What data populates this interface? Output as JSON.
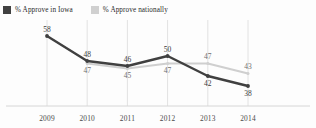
{
  "legend": {
    "items": [
      {
        "label": "% Approve in Iowa",
        "color": "#404040",
        "key": "iowa"
      },
      {
        "label": "% Approve nationally",
        "color": "#d0d0d0",
        "key": "national"
      }
    ]
  },
  "axis": {
    "x_ticks": [
      "2009",
      "2010",
      "2011",
      "2012",
      "2013",
      "2014"
    ]
  },
  "chart_data": {
    "type": "line",
    "title": "",
    "subtitle": "",
    "xlabel": "",
    "ylabel": "",
    "categories": [
      "2009",
      "2010",
      "2011",
      "2012",
      "2013",
      "2014"
    ],
    "series": [
      {
        "name": "% Approve in Iowa",
        "color": "#404040",
        "values": [
          58,
          48,
          46,
          50,
          42,
          38
        ],
        "label_positions": [
          "above",
          "above",
          "above",
          "above",
          "below",
          "below"
        ]
      },
      {
        "name": "% Approve nationally",
        "color": "#d0d0d0",
        "values": [
          null,
          47,
          45,
          47,
          47,
          43
        ],
        "label_positions": [
          null,
          "below",
          "below",
          "below",
          "above",
          "above"
        ]
      }
    ],
    "ylim": [
      30,
      62
    ],
    "grid": "vertical",
    "legend_position": "top-left",
    "data_labels": true
  },
  "labels": {
    "iowa": [
      "58",
      "48",
      "46",
      "50",
      "42",
      "38"
    ],
    "national": [
      "",
      "47",
      "45",
      "47",
      "47",
      "43"
    ]
  },
  "colors": {
    "iowa_line": "#404040",
    "national_line": "#cfcfcf",
    "gridline": "#e2e2e2",
    "baseline": "#d6d6d6",
    "background": "#fdfdfd",
    "text": "#3a3a3a"
  }
}
